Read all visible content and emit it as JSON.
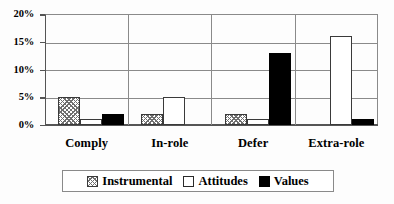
{
  "chart_data": {
    "type": "bar",
    "title": "",
    "xlabel": "",
    "ylabel": "",
    "categories": [
      "Comply",
      "In-role",
      "Defer",
      "Extra-role"
    ],
    "series": [
      {
        "name": "Instrumental",
        "values": [
          5,
          2,
          2,
          0
        ],
        "fill": "hatched"
      },
      {
        "name": "Attitudes",
        "values": [
          1,
          5,
          1,
          16
        ],
        "fill": "white"
      },
      {
        "name": "Values",
        "values": [
          2,
          0,
          13,
          1
        ],
        "fill": "black"
      }
    ],
    "ylim": [
      0,
      20
    ],
    "ytick_values": [
      0,
      5,
      10,
      15,
      20
    ],
    "ytick_labels": [
      "0%",
      "5%",
      "10%",
      "15%",
      "20%"
    ],
    "grid": true,
    "legend_position": "bottom",
    "value_unit": "%"
  },
  "colors": {
    "axis": "#555555",
    "gridline": "#8a8a8a",
    "hatch": "#6f6f6f",
    "black_bar": "#000000",
    "white_bar": "#ffffff",
    "background": "#fdfdfd"
  }
}
